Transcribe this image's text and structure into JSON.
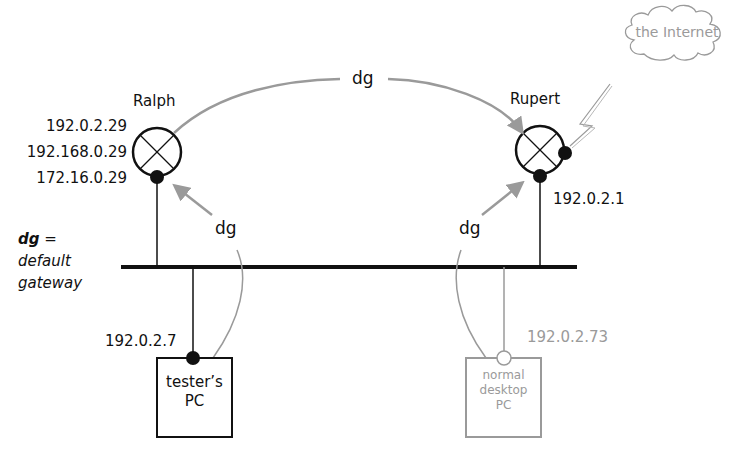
{
  "legend": {
    "abbr": "dg",
    "equals": "=",
    "line1": "default",
    "line2": "gateway"
  },
  "routers": {
    "ralph": {
      "name": "Ralph",
      "ips": [
        "192.0.2.29",
        "192.168.0.29",
        "172.16.0.29"
      ]
    },
    "rupert": {
      "name": "Rupert",
      "ip": "192.0.2.1"
    }
  },
  "hosts": {
    "tester": {
      "line1": "tester’s",
      "line2": "PC",
      "ip": "192.0.2.7"
    },
    "desktop": {
      "line1": "normal",
      "line2": "desktop",
      "line3": "PC",
      "ip": "192.0.2.73"
    }
  },
  "cloud": {
    "label": "the Internet"
  },
  "arrows": {
    "ralph_to_rupert": "dg",
    "tester_to_ralph": "dg",
    "desktop_to_rupert": "dg"
  },
  "colors": {
    "primary": "#111111",
    "secondary": "#9a9a9a",
    "background": "#ffffff"
  }
}
